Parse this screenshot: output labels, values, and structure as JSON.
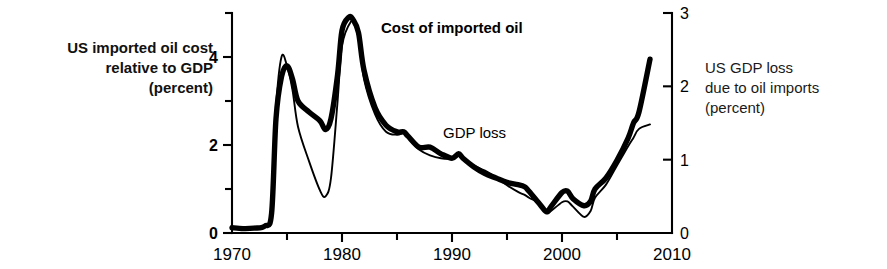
{
  "chart_data": {
    "type": "line",
    "title": "",
    "xlabel": "",
    "ylabel": "US imported oil cost relative to GDP (percent)",
    "y2label": "US GDP loss due to oil imports (percent)",
    "xlim": [
      1970,
      2010
    ],
    "ylim": [
      0,
      5
    ],
    "y2lim": [
      0,
      3
    ],
    "grid": false,
    "legend_position": "inline-annotations",
    "x_major_ticks": [
      1970,
      1980,
      1990,
      2000,
      2010
    ],
    "x_minor_ticks": [
      1975,
      1985,
      1995,
      2005
    ],
    "x_tick_labels": [
      "1970",
      "1980",
      "1990",
      "2000",
      "2010"
    ],
    "y_left_major_ticks": [
      0,
      2,
      4
    ],
    "y_left_minor_ticks": [
      1,
      3,
      5
    ],
    "y_left_tick_labels": [
      "0",
      "2",
      "4"
    ],
    "y_right_major_ticks": [
      0,
      1,
      2,
      3
    ],
    "y_right_tick_labels": [
      "0",
      "1",
      "2",
      "3"
    ],
    "annotations": [
      {
        "text": "Cost of imported oil",
        "x": 1981.5,
        "y": 4.95,
        "weight": "bold"
      },
      {
        "text": "GDP loss",
        "x": 1987.0,
        "y": 2.3,
        "weight": "normal"
      }
    ],
    "series": [
      {
        "name": "Cost of imported oil",
        "axis": "left",
        "style": "thick",
        "label": "Cost of imported oil",
        "x": [
          1970,
          1971,
          1972,
          1973,
          1973.6,
          1974,
          1974.5,
          1975,
          1975.5,
          1976,
          1977,
          1978,
          1978.5,
          1979,
          1979.6,
          1980,
          1980.6,
          1981,
          1981.5,
          1982,
          1983,
          1984,
          1985,
          1985.6,
          1986,
          1987,
          1988,
          1989,
          1990,
          1990.6,
          1991,
          1992,
          1993,
          1994,
          1995,
          1996,
          1996.6,
          1997,
          1998,
          1998.6,
          1999,
          2000,
          2000.5,
          2001,
          2002,
          2002.6,
          2003,
          2004,
          2005,
          2006,
          2006.5,
          2007,
          2008
        ],
        "y": [
          0.12,
          0.1,
          0.11,
          0.16,
          0.45,
          2.6,
          3.55,
          3.8,
          3.5,
          3.0,
          2.75,
          2.55,
          2.35,
          2.6,
          3.6,
          4.6,
          4.9,
          4.85,
          4.55,
          3.7,
          2.85,
          2.45,
          2.3,
          2.3,
          2.2,
          1.95,
          1.95,
          1.8,
          1.7,
          1.8,
          1.7,
          1.5,
          1.35,
          1.25,
          1.15,
          1.1,
          1.05,
          0.95,
          0.65,
          0.48,
          0.6,
          0.92,
          0.95,
          0.78,
          0.62,
          0.72,
          1.0,
          1.25,
          1.65,
          2.15,
          2.5,
          2.75,
          3.95
        ]
      },
      {
        "name": "GDP loss",
        "axis": "right",
        "style": "thin",
        "label": "GDP loss",
        "x": [
          1970,
          1971,
          1972,
          1973,
          1973.6,
          1974,
          1974.5,
          1975,
          1975.5,
          1976,
          1977,
          1978,
          1978.5,
          1979,
          1979.6,
          1980,
          1980.8,
          1981.2,
          1981.6,
          1982,
          1983,
          1984,
          1985,
          1985.6,
          1986,
          1987,
          1988,
          1989,
          1990,
          1990.6,
          1991,
          1992,
          1993,
          1994,
          1995,
          1996,
          1996.6,
          1997,
          1998,
          1998.6,
          1999,
          2000,
          2000.5,
          2001,
          2002,
          2002.6,
          2003,
          2004,
          2005,
          2006,
          2006.5,
          2007,
          2008
        ],
        "y": [
          0.07,
          0.06,
          0.07,
          0.1,
          0.3,
          1.7,
          2.4,
          2.28,
          1.95,
          1.45,
          0.98,
          0.58,
          0.5,
          0.75,
          1.8,
          2.55,
          2.88,
          2.82,
          2.6,
          2.1,
          1.62,
          1.38,
          1.34,
          1.36,
          1.3,
          1.14,
          1.06,
          1.02,
          1.02,
          1.1,
          1.0,
          0.92,
          0.85,
          0.76,
          0.65,
          0.56,
          0.52,
          0.48,
          0.4,
          0.28,
          0.3,
          0.42,
          0.43,
          0.36,
          0.22,
          0.3,
          0.48,
          0.66,
          0.92,
          1.18,
          1.3,
          1.42,
          1.48
        ]
      }
    ]
  },
  "labels": {
    "left_axis_title": "US imported oil cost\nrelative to GDP\n(percent)",
    "right_axis_title": "US GDP loss\ndue to oil imports\n(percent)",
    "cost_series_label": "Cost of imported oil",
    "gdp_series_label": "GDP loss"
  },
  "colors": {
    "background": "#ffffff",
    "ink": "#000000",
    "axis": "#000000"
  }
}
